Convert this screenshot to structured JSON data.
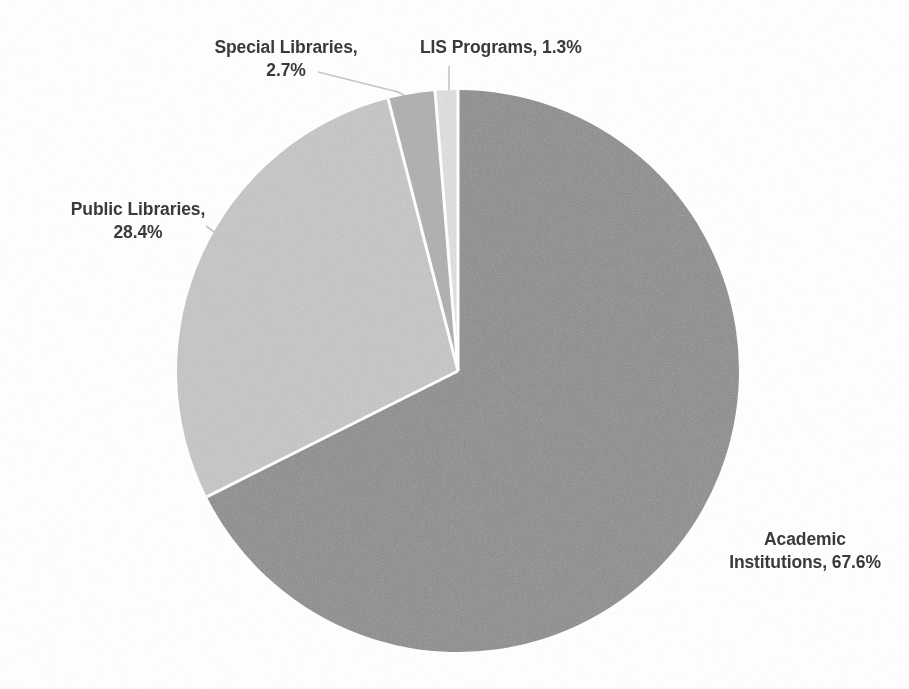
{
  "chart_data": {
    "type": "pie",
    "title": "",
    "subtitle": "",
    "xlabel": "",
    "ylabel": "",
    "legend_position": "none",
    "grid": false,
    "labels_inline": true,
    "units": "percent",
    "start_angle_deg": 0,
    "direction": "clockwise",
    "categories": [
      "Academic Institutions",
      "Public Libraries",
      "Special Libraries",
      "LIS Programs"
    ],
    "values": [
      67.6,
      28.4,
      2.7,
      1.3
    ],
    "slices": [
      {
        "name": "Academic Institutions",
        "value": 67.6,
        "label": "Academic\nInstitutions, 67.6%",
        "color": "#8c8c8c",
        "start_deg": 0,
        "end_deg": 243.4,
        "leader": false
      },
      {
        "name": "Public Libraries",
        "value": 28.4,
        "label": "Public Libraries,\n28.4%",
        "color": "#c9c9c9",
        "start_deg": 243.4,
        "end_deg": 345.6,
        "leader": true
      },
      {
        "name": "Special Libraries",
        "value": 2.7,
        "label": "Special Libraries,\n2.7%",
        "color": "#b0b0b0",
        "start_deg": 345.6,
        "end_deg": 355.3,
        "leader": true
      },
      {
        "name": "LIS Programs",
        "value": 1.3,
        "label": "LIS Programs, 1.3%",
        "color": "#e4e4e4",
        "start_deg": 355.3,
        "end_deg": 360,
        "leader": true
      }
    ],
    "geometry": {
      "center_x": 458,
      "center_y": 371,
      "radius": 281
    },
    "style": {
      "background": "#ffffff",
      "separator_color": "#ffffff",
      "separator_width": 3,
      "label_color": "#3a3a3a",
      "leader_color": "#c0c0c0"
    }
  }
}
